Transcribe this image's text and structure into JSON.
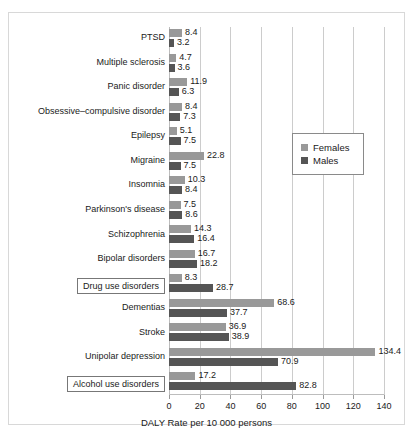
{
  "chart_data": {
    "type": "bar",
    "orientation": "horizontal",
    "title": "",
    "xlabel": "DALY Rate per 10 000 persons",
    "ylabel": "",
    "xlim": [
      0,
      140
    ],
    "xticks": [
      0,
      20,
      40,
      60,
      80,
      100,
      120,
      140
    ],
    "grid": true,
    "legend_position": "upper right inside plot",
    "categories": [
      "PTSD",
      "Multiple sclerosis",
      "Panic disorder",
      "Obsessive–compulsive disorder",
      "Epilepsy",
      "Migraine",
      "Insomnia",
      "Parkinson's disease",
      "Schizophrenia",
      "Bipolar disorders",
      "Drug use disorders",
      "Dementias",
      "Stroke",
      "Unipolar depression",
      "Alcohol use disorders"
    ],
    "highlighted_categories": [
      "Drug use disorders",
      "Alcohol use disorders"
    ],
    "series": [
      {
        "name": "Females",
        "color": "#999999",
        "values": [
          8.4,
          4.7,
          11.9,
          8.4,
          5.1,
          22.8,
          10.3,
          7.5,
          14.3,
          16.7,
          8.3,
          68.6,
          36.9,
          134.4,
          17.2
        ]
      },
      {
        "name": "Males",
        "color": "#555555",
        "values": [
          3.2,
          3.6,
          6.3,
          7.3,
          7.5,
          7.5,
          8.4,
          8.6,
          16.4,
          18.2,
          28.7,
          37.7,
          38.9,
          70.9,
          82.8
        ]
      }
    ]
  },
  "legend": {
    "entries": [
      {
        "label": "Females",
        "color": "#999999"
      },
      {
        "label": "Males",
        "color": "#555555"
      }
    ]
  }
}
